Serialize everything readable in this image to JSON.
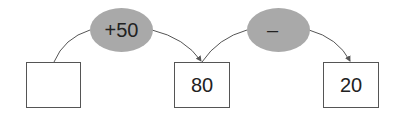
{
  "diagram": {
    "boxes": [
      {
        "id": "start",
        "value": ""
      },
      {
        "id": "middle",
        "value": "80"
      },
      {
        "id": "end",
        "value": "20"
      }
    ],
    "operations": [
      {
        "id": "op1",
        "label": "+50"
      },
      {
        "id": "op2",
        "label": "–"
      }
    ],
    "colors": {
      "oval_fill": "#a9a9a9",
      "line": "#555555"
    }
  }
}
